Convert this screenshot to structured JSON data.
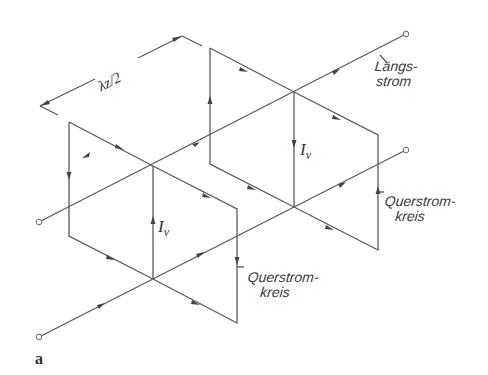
{
  "figure": {
    "label": "a",
    "dimension_label": "λz/2",
    "current_label": "Iv",
    "current_label_base": "I",
    "current_label_sub": "v",
    "labels": {
      "laengsstrom": [
        "Längs-",
        "strom"
      ],
      "querstromkreis_right": [
        "Querstrom-",
        "kreis"
      ],
      "querstromkreis_bottom": [
        "Querstrom-",
        "kreis"
      ]
    },
    "colors": {
      "line": "#5a5a5a",
      "text": "#333333",
      "background": "#ffffff"
    }
  }
}
